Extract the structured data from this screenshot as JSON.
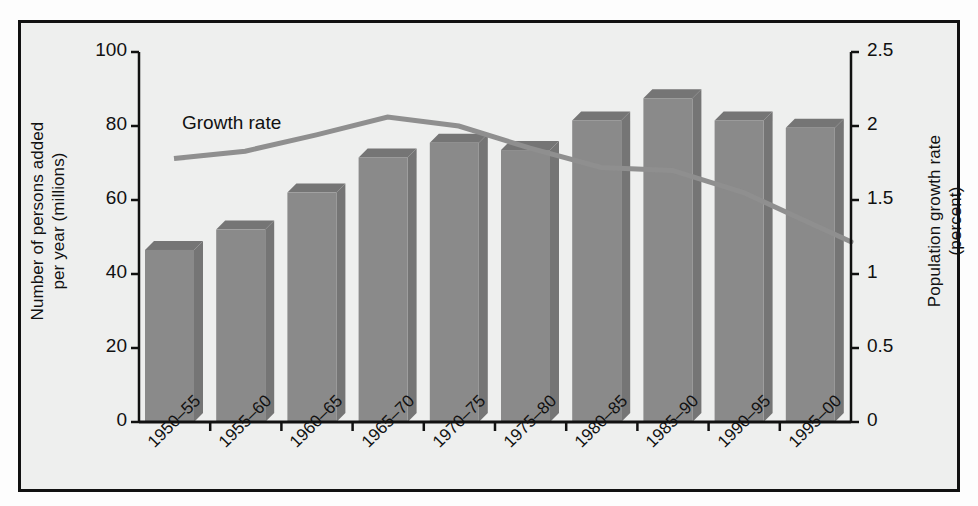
{
  "chart_data": {
    "type": "bar",
    "title": "",
    "subtitle": "",
    "categories": [
      "1950–55",
      "1955–60",
      "1960–65",
      "1965–70",
      "1970–75",
      "1975–80",
      "1980–85",
      "1985–90",
      "1990–95",
      "1995–00"
    ],
    "series": [
      {
        "name": "Number of persons added per year (millions)",
        "type": "bar",
        "axis": "left",
        "values": [
          46.5,
          52.0,
          62.0,
          71.5,
          75.5,
          73.5,
          81.5,
          87.5,
          81.5,
          79.5
        ]
      },
      {
        "name": "Growth rate",
        "type": "line",
        "axis": "right",
        "values": [
          1.78,
          1.83,
          1.94,
          2.06,
          2.0,
          1.85,
          1.72,
          1.7,
          1.55,
          1.33
        ]
      }
    ],
    "xlabel": "",
    "ylabel": "Number of persons added\nper year (millions)",
    "y2label": "Population growth rate\n(percent)",
    "ylim": [
      0,
      100
    ],
    "yticks": [
      0,
      20,
      40,
      60,
      80,
      100
    ],
    "ytick_labels": [
      "0",
      "20",
      "40",
      "60",
      "80",
      "100"
    ],
    "y2lim": [
      0,
      2.5
    ],
    "y2ticks": [
      0,
      0.5,
      1,
      1.5,
      2,
      2.5
    ],
    "y2tick_labels": [
      "0",
      "0.5",
      "1",
      "1.5",
      "2",
      "2.5"
    ],
    "grid": false,
    "legend_position": "inline-annotation",
    "annotations": [
      {
        "text": "Growth rate",
        "x_category": "1950–55",
        "note": "label placed above the growth-rate line near the left of the plot"
      }
    ],
    "colors": {
      "bar_front": "#8a8a8a",
      "bar_side": "#757575",
      "line": "#8f8f8f",
      "axis": "#111111",
      "plot_background": "#eeefee",
      "frame": "#111111"
    }
  },
  "labels": {
    "y_left_title": "Number of persons added\nper year (millions)",
    "y_right_title": "Population growth rate\n(percent)",
    "growth_rate_label": "Growth rate"
  }
}
